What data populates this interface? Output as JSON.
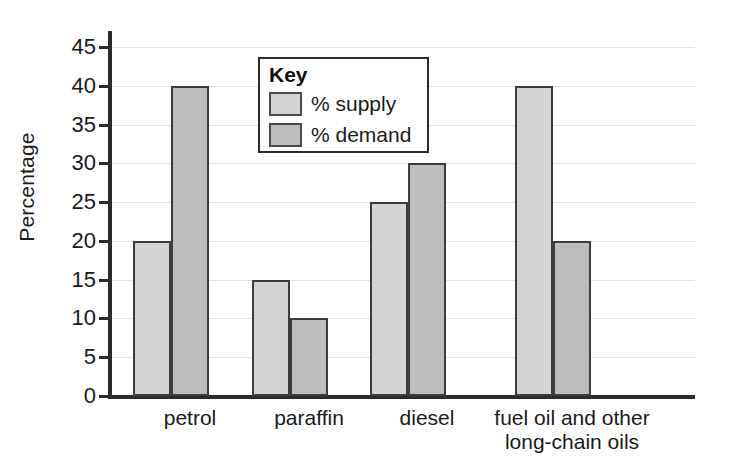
{
  "chart_data": {
    "type": "bar",
    "title": "",
    "xlabel": "",
    "ylabel": "Percentage",
    "categories": [
      "petrol",
      "paraffin",
      "diesel",
      "fuel oil and other long-chain oils"
    ],
    "series": [
      {
        "name": "% supply",
        "values": [
          20,
          15,
          25,
          40
        ],
        "color": "#d4d4d4"
      },
      {
        "name": "% demand",
        "values": [
          40,
          10,
          30,
          20
        ],
        "color": "#bdbdbd"
      }
    ],
    "ylim": [
      0,
      45
    ],
    "ytick_step": 5,
    "ytick_labels": [
      "45",
      "40",
      "35",
      "30",
      "25",
      "20",
      "15",
      "10",
      "5",
      "0"
    ],
    "grid": true,
    "legend_position": "top-left-inside"
  },
  "legend": {
    "title": "Key",
    "entries": [
      {
        "label": "% supply"
      },
      {
        "label": "% demand"
      }
    ]
  },
  "axis": {
    "y_title": "Percentage"
  },
  "categories": [
    {
      "line1": "petrol",
      "line2": ""
    },
    {
      "line1": "paraffin",
      "line2": ""
    },
    {
      "line1": "diesel",
      "line2": ""
    },
    {
      "line1": "fuel oil and other",
      "line2": "long-chain oils"
    }
  ],
  "colors": {
    "supply": "#d4d4d4",
    "demand": "#bdbdbd",
    "axis": "#2b2b2b",
    "grid": "#e4e4e4",
    "bar_outline": "#3c3c3c"
  }
}
